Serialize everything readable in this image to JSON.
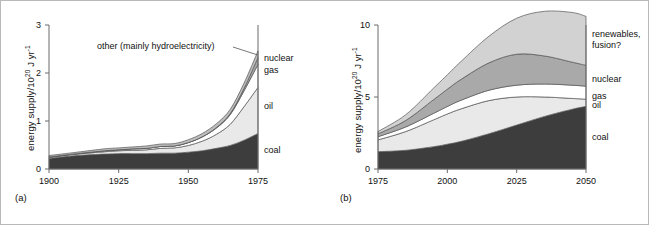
{
  "figure": {
    "panels": [
      {
        "tag": "(a)",
        "ylabel_main": "energy supply/10",
        "ylabel_sup": "20",
        "ylabel_tail": " J yr",
        "ylabel_sup2": "-1",
        "annotation": "other (mainly hydroelectricity)",
        "series_labels": [
          "nuclear",
          "gas",
          "oil",
          "coal"
        ]
      },
      {
        "tag": "(b)",
        "ylabel_main": "energy supply/10",
        "ylabel_sup": "20",
        "ylabel_tail": " J yr",
        "ylabel_sup2": "-1",
        "series_labels": [
          "renewables,",
          "fusion?",
          "nuclear",
          "gas",
          "oil",
          "coal"
        ]
      }
    ]
  },
  "colors": {
    "coal": "#3d3d3d",
    "oil": "#e9e9e9",
    "gas": "#ffffff",
    "nuclear": "#a9a9a9",
    "other": "#bdbdbd",
    "renewables": "#d2d2d2",
    "axis": "#6a6a6a",
    "stroke": "#555555",
    "text": "#111111",
    "frame": "#b9b9b9"
  },
  "chart_data": [
    {
      "type": "area",
      "id": "panel-a",
      "title": "",
      "xlabel": "",
      "ylabel": "energy supply/10^20 J yr^-1",
      "xlim": [
        1900,
        1975
      ],
      "ylim": [
        0,
        3
      ],
      "xticks": [
        1900,
        1925,
        1950,
        1975
      ],
      "xtick_labels": [
        "1900",
        "1925",
        "1950",
        "1975"
      ],
      "yticks": [
        0,
        1,
        2,
        3
      ],
      "ytick_labels": [
        "0",
        "1",
        "2",
        "3"
      ],
      "grid": false,
      "legend": "right-edge-inline",
      "stacked": true,
      "x": [
        1900,
        1910,
        1920,
        1925,
        1930,
        1935,
        1940,
        1945,
        1950,
        1955,
        1960,
        1965,
        1970,
        1975
      ],
      "series": [
        {
          "name": "coal",
          "values": [
            0.22,
            0.28,
            0.31,
            0.32,
            0.32,
            0.32,
            0.33,
            0.33,
            0.35,
            0.38,
            0.43,
            0.49,
            0.6,
            0.74
          ]
        },
        {
          "name": "oil",
          "values": [
            0.02,
            0.03,
            0.05,
            0.06,
            0.07,
            0.08,
            0.1,
            0.11,
            0.14,
            0.2,
            0.29,
            0.44,
            0.7,
            0.96
          ]
        },
        {
          "name": "gas",
          "values": [
            0.01,
            0.01,
            0.02,
            0.02,
            0.03,
            0.03,
            0.04,
            0.04,
            0.06,
            0.09,
            0.13,
            0.2,
            0.33,
            0.48
          ]
        },
        {
          "name": "nuclear",
          "values": [
            0.0,
            0.0,
            0.0,
            0.0,
            0.0,
            0.0,
            0.0,
            0.0,
            0.0,
            0.0,
            0.01,
            0.02,
            0.05,
            0.14
          ]
        },
        {
          "name": "other",
          "values": [
            0.03,
            0.03,
            0.04,
            0.04,
            0.04,
            0.05,
            0.05,
            0.05,
            0.06,
            0.07,
            0.08,
            0.09,
            0.11,
            0.14
          ]
        }
      ],
      "annotations": [
        {
          "text": "other (mainly hydroelectricity)",
          "points_to": [
            1975,
            2.38
          ]
        }
      ]
    },
    {
      "type": "area",
      "id": "panel-b",
      "title": "",
      "xlabel": "",
      "ylabel": "energy supply/10^20 J yr^-1",
      "xlim": [
        1975,
        2050
      ],
      "ylim": [
        0,
        10
      ],
      "xticks": [
        1975,
        2000,
        2025,
        2050
      ],
      "xtick_labels": [
        "1975",
        "2000",
        "2025",
        "2050"
      ],
      "yticks": [
        0,
        5,
        10
      ],
      "ytick_labels": [
        "0",
        "5",
        "10"
      ],
      "grid": false,
      "legend": "right-edge-inline",
      "stacked": true,
      "x": [
        1975,
        1985,
        1995,
        2000,
        2005,
        2015,
        2025,
        2035,
        2045,
        2050
      ],
      "series": [
        {
          "name": "coal",
          "values": [
            1.2,
            1.3,
            1.55,
            1.72,
            1.92,
            2.45,
            3.05,
            3.65,
            4.15,
            4.35
          ]
        },
        {
          "name": "oil",
          "values": [
            0.82,
            1.3,
            1.86,
            2.1,
            2.26,
            2.3,
            1.95,
            1.35,
            0.75,
            0.5
          ]
        },
        {
          "name": "gas",
          "values": [
            0.22,
            0.32,
            0.45,
            0.52,
            0.6,
            0.72,
            0.82,
            0.9,
            0.92,
            0.9
          ]
        },
        {
          "name": "nuclear",
          "values": [
            0.2,
            0.45,
            0.95,
            1.2,
            1.45,
            1.9,
            2.15,
            1.95,
            1.6,
            1.45
          ]
        },
        {
          "name": "renewables",
          "values": [
            0.16,
            0.4,
            0.8,
            1.0,
            1.25,
            1.85,
            2.5,
            3.1,
            3.45,
            3.4
          ]
        }
      ]
    }
  ]
}
